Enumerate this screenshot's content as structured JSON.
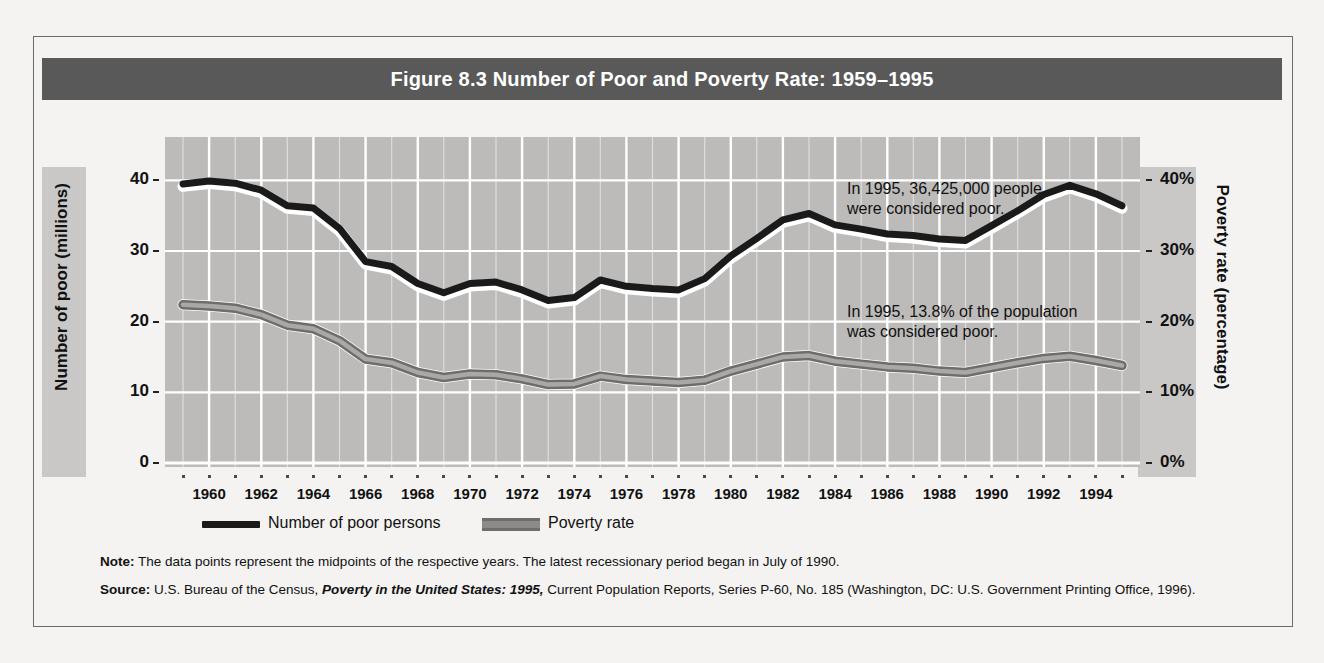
{
  "figure": {
    "title": "Figure 8.3  Number of Poor and Poverty Rate: 1959–1995",
    "note_label": "Note:",
    "note_text": " The data points represent the midpoints of the respective years. The latest recessionary period began in July of 1990.",
    "source_label": "Source:",
    "source_pre": " U.S. Bureau of the Census, ",
    "source_italic": "Poverty in the United States: 1995,",
    "source_post": " Current Population Reports, Series P-60, No. 185 (Washington, DC: U.S. Government Printing Office, 1996)."
  },
  "legend": {
    "items": [
      {
        "label": "Number of poor persons",
        "swatch": "thick-black-line"
      },
      {
        "label": "Poverty rate",
        "swatch": "grey-double-line"
      }
    ]
  },
  "annotations": [
    {
      "id": "poor-count-1995",
      "text": "In 1995, 36,425,000 people\nwere considered poor."
    },
    {
      "id": "poverty-rate-1995",
      "text": "In 1995, 13.8% of the population\nwas considered poor."
    }
  ],
  "colors": {
    "title_bar": "#595959",
    "plot_background": "#bcbbb9",
    "axis_band": "#c9c8c6",
    "gridline": "#ffffff",
    "series_poor_persons": "#1a1a1a",
    "series_poverty_rate": "#6e6d6b",
    "page_background": "#f4f3f1",
    "frame_border": "#6b6b6b"
  },
  "chart_data": {
    "type": "line",
    "title": "Figure 8.3  Number of Poor and Poverty Rate: 1959–1995",
    "xlabel": "",
    "ylabel": "Number of poor (millions)",
    "y2label": "Poverty rate (percentage)",
    "xlim": [
      1959,
      1995
    ],
    "ylim": [
      0,
      45
    ],
    "y2lim": [
      0,
      45
    ],
    "yticks": [
      0,
      10,
      20,
      30,
      40
    ],
    "ytick_labels": [
      "0",
      "10",
      "20",
      "30",
      "40"
    ],
    "y2ticks": [
      0,
      10,
      20,
      30,
      40
    ],
    "y2tick_labels": [
      "0%",
      "10%",
      "20%",
      "30%",
      "40%"
    ],
    "xticks": [
      1960,
      1962,
      1964,
      1966,
      1968,
      1970,
      1972,
      1974,
      1976,
      1978,
      1980,
      1982,
      1984,
      1986,
      1988,
      1990,
      1992,
      1994
    ],
    "xtick_labels": [
      "1960",
      "1962",
      "1964",
      "1966",
      "1968",
      "1970",
      "1972",
      "1974",
      "1976",
      "1978",
      "1980",
      "1982",
      "1984",
      "1986",
      "1988",
      "1990",
      "1992",
      "1994"
    ],
    "grid": true,
    "legend_position": "below-plot",
    "x": [
      1959,
      1960,
      1961,
      1962,
      1963,
      1964,
      1965,
      1966,
      1967,
      1968,
      1969,
      1970,
      1971,
      1972,
      1973,
      1974,
      1975,
      1976,
      1977,
      1978,
      1979,
      1980,
      1981,
      1982,
      1983,
      1984,
      1985,
      1986,
      1987,
      1988,
      1989,
      1990,
      1991,
      1992,
      1993,
      1994,
      1995
    ],
    "series": [
      {
        "name": "Number of poor persons",
        "axis": "left",
        "units": "millions",
        "values": [
          39.5,
          39.9,
          39.6,
          38.6,
          36.4,
          36.1,
          33.2,
          28.5,
          27.8,
          25.4,
          24.1,
          25.4,
          25.6,
          24.5,
          23.0,
          23.4,
          25.9,
          25.0,
          24.7,
          24.5,
          26.1,
          29.3,
          31.8,
          34.4,
          35.3,
          33.7,
          33.1,
          32.4,
          32.2,
          31.7,
          31.5,
          33.6,
          35.7,
          38.0,
          39.3,
          38.1,
          36.4
        ]
      },
      {
        "name": "Poverty rate",
        "axis": "right",
        "units": "percent",
        "values": [
          22.4,
          22.2,
          21.9,
          21.0,
          19.5,
          19.0,
          17.3,
          14.7,
          14.2,
          12.8,
          12.1,
          12.6,
          12.5,
          11.9,
          11.1,
          11.2,
          12.3,
          11.8,
          11.6,
          11.4,
          11.7,
          13.0,
          14.0,
          15.0,
          15.2,
          14.4,
          14.0,
          13.6,
          13.4,
          13.0,
          12.8,
          13.5,
          14.2,
          14.8,
          15.1,
          14.5,
          13.8
        ]
      }
    ]
  }
}
